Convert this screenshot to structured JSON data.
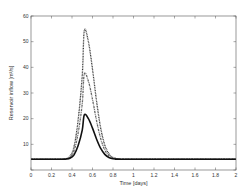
{
  "chart_data": {
    "type": "line",
    "title": "",
    "xlabel": "Time [days]",
    "ylabel": "Reservoir inflow [m³/s]",
    "xlim": [
      0,
      2
    ],
    "ylim": [
      0,
      60
    ],
    "xticks": [
      0,
      0.2,
      0.4,
      0.6,
      0.8,
      1,
      1.2,
      1.4,
      1.6,
      1.8,
      2
    ],
    "xtick_labels": [
      "0",
      "0.2",
      "0.4",
      "0.6",
      "0.8",
      "1",
      "1.2",
      "1.4",
      "1.6",
      "1.8",
      "2"
    ],
    "yticks": [
      0,
      10,
      20,
      30,
      40,
      50,
      60
    ],
    "ytick_labels": [
      "",
      "10",
      "20",
      "30",
      "40",
      "50",
      "60"
    ],
    "grid": false,
    "legend": null,
    "x": [
      0,
      0.3,
      0.34,
      0.38,
      0.42,
      0.46,
      0.5,
      0.52,
      0.56,
      0.6,
      0.64,
      0.68,
      0.72,
      0.76,
      0.8,
      0.86,
      0.92,
      2.0
    ],
    "series": [
      {
        "name": "Series 1 (highest peak)",
        "style": "dotted",
        "color": "#333333",
        "values": [
          4.2,
          4.2,
          4.4,
          5.3,
          9.1,
          19.5,
          36.9,
          54.2,
          50.0,
          39.3,
          26.7,
          16.3,
          9.7,
          6.3,
          4.9,
          4.3,
          4.2,
          4.2
        ]
      },
      {
        "name": "Series 2 (middle peak)",
        "style": "dash-dot",
        "color": "#666666",
        "values": [
          4.2,
          4.2,
          4.3,
          4.9,
          7.5,
          14.4,
          25.9,
          37.4,
          34.6,
          27.5,
          19.1,
          12.2,
          7.8,
          5.6,
          4.6,
          4.3,
          4.2,
          4.2
        ]
      },
      {
        "name": "Series 3 (lowest peak)",
        "style": "solid",
        "color": "#111111",
        "values": [
          4.2,
          4.2,
          4.3,
          4.6,
          5.9,
          9.5,
          15.5,
          21.5,
          20.0,
          16.3,
          12.0,
          8.4,
          6.1,
          4.9,
          4.4,
          4.2,
          4.2,
          4.2
        ]
      }
    ]
  }
}
